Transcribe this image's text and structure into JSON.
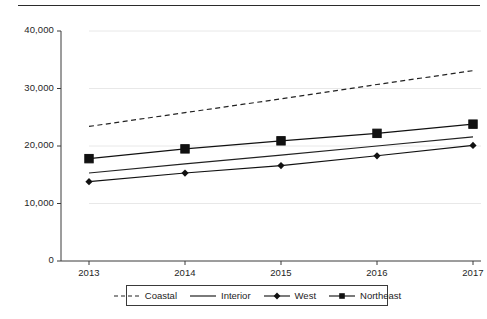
{
  "chart_data": {
    "type": "line",
    "title": "",
    "subtitle": "",
    "xlabel": "",
    "ylabel": "",
    "categories": [
      "2013",
      "2014",
      "2015",
      "2016",
      "2017"
    ],
    "x": [
      2013,
      2014,
      2015,
      2016,
      2017
    ],
    "xlim": [
      2013,
      2017
    ],
    "ylim": [
      0,
      40000
    ],
    "y_ticks": [
      0,
      10000,
      20000,
      30000,
      40000
    ],
    "y_tick_labels": [
      "0",
      "10,000",
      "20,000",
      "30,000",
      "40,000"
    ],
    "x_tick_labels": [
      "2013",
      "2014",
      "2015",
      "2016",
      "2017"
    ],
    "grid": "horizontal-faint",
    "legend_position": "bottom-center",
    "series": [
      {
        "name": "Coastal",
        "style": "dashed",
        "marker": "none",
        "color": "#222222",
        "values": [
          23400,
          25800,
          28200,
          30700,
          33100
        ]
      },
      {
        "name": "Interior",
        "style": "solid",
        "marker": "none",
        "color": "#222222",
        "values": [
          15300,
          16900,
          18400,
          20000,
          21600
        ]
      },
      {
        "name": "West",
        "style": "solid",
        "marker": "diamond",
        "color": "#111111",
        "values": [
          13800,
          15300,
          16600,
          18300,
          20100
        ]
      },
      {
        "name": "Northeast",
        "style": "solid",
        "marker": "square",
        "color": "#111111",
        "values": [
          17800,
          19500,
          20900,
          22200,
          23800
        ]
      }
    ]
  },
  "legend": {
    "items": [
      {
        "label": "Coastal",
        "sample": "dashed-line-sample"
      },
      {
        "label": "Interior",
        "sample": "solid-line-sample"
      },
      {
        "label": "West",
        "sample": "solid-line-diamond-sample"
      },
      {
        "label": "Northeast",
        "sample": "solid-line-square-sample"
      }
    ]
  },
  "axes": {
    "y_labels": [
      "40,000",
      "30,000",
      "20,000",
      "10,000",
      "0"
    ],
    "x_labels": [
      "2013",
      "2014",
      "2015",
      "2016",
      "2017"
    ]
  },
  "colors": {
    "line": "#222222",
    "axis": "#3a3a3a",
    "grid": "#e8e8e8",
    "text": "#1d1d1d",
    "background": "#ffffff"
  }
}
